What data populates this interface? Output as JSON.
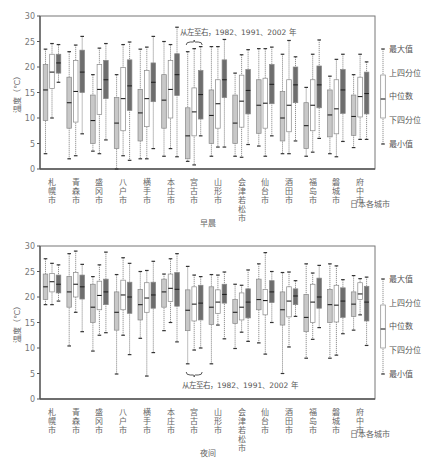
{
  "chart_data": [
    {
      "type": "box",
      "title": "早晨",
      "xlabel": "日本各城市",
      "ylabel": "温度（℃）",
      "ylim": [
        0,
        30
      ],
      "yticks": [
        0,
        5,
        10,
        15,
        20,
        25,
        30
      ],
      "annotation": "从左至右，1982、1991、2002 年",
      "series_names": [
        "1982",
        "1991",
        "2002"
      ],
      "categories": [
        "札幌市",
        "青森市",
        "盛冈市",
        "八户市",
        "横手市",
        "本庄市",
        "宫古市",
        "山形市",
        "会津若松市",
        "仙台市",
        "酒田市",
        "福岛市",
        "磐城市",
        "府中市"
      ],
      "boxes": [
        [
          [
            3.0,
            9.5,
            15.5,
            20.5,
            23.5
          ],
          [
            10.0,
            15.8,
            19.0,
            22.5,
            24.6
          ],
          [
            17.0,
            18.8,
            20.8,
            22.5,
            24.4
          ]
        ],
        [
          [
            2.0,
            8.0,
            13.0,
            18.0,
            23.0
          ],
          [
            2.6,
            9.2,
            15.2,
            21.3,
            24.3
          ],
          [
            6.9,
            15.0,
            19.0,
            23.3,
            26.0
          ]
        ],
        [
          [
            3.5,
            5.0,
            9.5,
            14.5,
            18.5
          ],
          [
            3.0,
            10.7,
            15.6,
            20.5,
            23.7
          ],
          [
            5.7,
            13.8,
            17.5,
            21.3,
            24.6
          ]
        ],
        [
          [
            0.0,
            4.0,
            9.0,
            14.0,
            18.5
          ],
          [
            2.6,
            7.5,
            13.8,
            19.9,
            24.4
          ],
          [
            1.7,
            11.5,
            16.3,
            21.4,
            24.9
          ]
        ],
        [
          [
            2.0,
            5.5,
            11.0,
            15.6,
            23.5
          ],
          [
            2.0,
            8.3,
            13.8,
            19.3,
            23.9
          ],
          [
            4.0,
            13.2,
            17.0,
            20.8,
            26.0
          ]
        ],
        [
          [
            2.5,
            8.0,
            13.5,
            18.5,
            25.0
          ],
          [
            4.0,
            10.0,
            15.6,
            21.3,
            24.4
          ],
          [
            2.4,
            14.4,
            18.5,
            22.6,
            27.8
          ]
        ],
        [
          [
            1.5,
            2.0,
            6.5,
            12.0,
            23.0
          ],
          [
            0.8,
            6.5,
            11.2,
            15.9,
            23.6
          ],
          [
            6.5,
            9.8,
            14.6,
            19.3,
            24.0
          ]
        ],
        [
          [
            2.5,
            5.0,
            10.5,
            15.5,
            24.0
          ],
          [
            4.3,
            8.0,
            12.8,
            17.5,
            24.0
          ],
          [
            4.3,
            14.0,
            17.5,
            21.4,
            25.4
          ]
        ],
        [
          [
            2.5,
            5.0,
            9.0,
            14.5,
            18.8
          ],
          [
            2.3,
            8.2,
            13.3,
            18.4,
            22.4
          ],
          [
            4.8,
            10.8,
            15.4,
            19.5,
            23.4
          ]
        ],
        [
          [
            4.5,
            7.0,
            12.5,
            17.5,
            23.6
          ],
          [
            2.5,
            8.0,
            12.9,
            17.8,
            23.6
          ],
          [
            6.5,
            12.8,
            16.6,
            20.5,
            23.9
          ]
        ],
        [
          [
            3.0,
            5.5,
            10.0,
            15.2,
            22.5
          ],
          [
            3.0,
            7.3,
            12.5,
            17.5,
            25.2
          ],
          [
            5.5,
            13.0,
            16.5,
            20.0,
            22.0
          ]
        ],
        [
          [
            2.5,
            4.0,
            8.5,
            13.0,
            16.0
          ],
          [
            3.3,
            7.5,
            12.5,
            17.5,
            22.5
          ],
          [
            6.0,
            12.0,
            16.5,
            20.2,
            25.3
          ]
        ],
        [
          [
            3.0,
            6.3,
            10.6,
            15.5,
            18.2
          ],
          [
            2.4,
            6.9,
            11.8,
            17.5,
            21.5
          ],
          [
            5.4,
            10.9,
            15.5,
            19.5,
            22.5
          ]
        ],
        [
          [
            4.2,
            6.6,
            10.3,
            14.5,
            18.5
          ],
          [
            5.8,
            10.2,
            14.2,
            18.0,
            22.5
          ],
          [
            5.8,
            10.8,
            14.8,
            19.0,
            21.0
          ]
        ]
      ]
    },
    {
      "type": "box",
      "title": "夜间",
      "xlabel": "日本各城市",
      "ylabel": "温度（℃）",
      "ylim": [
        0,
        30
      ],
      "yticks": [
        0,
        5,
        10,
        15,
        20,
        25,
        30
      ],
      "annotation": "从左至右，1982、1991、2002 年",
      "series_names": [
        "1982",
        "1991",
        "2002"
      ],
      "categories": [
        "札幌市",
        "青森市",
        "盛冈市",
        "八户市",
        "横手市",
        "本庄市",
        "宫古市",
        "山形市",
        "会津若松市",
        "仙台市",
        "酒田市",
        "福岛市",
        "磐城市",
        "府中市"
      ],
      "boxes": [
        [
          [
            18.5,
            19.5,
            22.0,
            24.5,
            27.5
          ],
          [
            18.5,
            21.0,
            23.0,
            24.6,
            26.6
          ],
          [
            19.2,
            20.8,
            22.5,
            24.3,
            26.3
          ]
        ],
        [
          [
            10.4,
            18.0,
            21.0,
            24.0,
            28.5
          ],
          [
            17.0,
            20.0,
            22.5,
            24.8,
            29.0
          ],
          [
            13.2,
            19.6,
            22.0,
            24.3,
            26.4
          ]
        ],
        [
          [
            9.4,
            15.0,
            18.0,
            22.5,
            24.0
          ],
          [
            12.5,
            17.5,
            20.3,
            23.1,
            26.3
          ],
          [
            13.0,
            18.5,
            21.0,
            23.5,
            28.8
          ]
        ],
        [
          [
            4.9,
            13.5,
            17.0,
            21.0,
            24.4
          ],
          [
            12.5,
            17.5,
            20.4,
            23.3,
            27.7
          ],
          [
            8.7,
            16.8,
            20.0,
            22.9,
            26.6
          ]
        ],
        [
          [
            11.9,
            15.5,
            18.5,
            21.5,
            25.0
          ],
          [
            4.5,
            17.0,
            19.8,
            22.8,
            25.2
          ],
          [
            9.1,
            17.8,
            20.4,
            22.9,
            27.0
          ]
        ],
        [
          [
            13.4,
            18.0,
            21.0,
            23.5,
            24.5
          ],
          [
            15.0,
            19.1,
            21.7,
            24.5,
            27.5
          ],
          [
            11.2,
            18.2,
            21.5,
            24.8,
            28.5
          ]
        ],
        [
          [
            6.9,
            13.4,
            17.4,
            21.4,
            26.0
          ],
          [
            9.6,
            15.3,
            18.6,
            22.0,
            24.3
          ],
          [
            10.0,
            15.5,
            18.8,
            22.3,
            24.0
          ]
        ],
        [
          [
            6.9,
            14.6,
            18.0,
            22.0,
            24.4
          ],
          [
            14.5,
            16.8,
            19.0,
            21.4,
            24.3
          ],
          [
            11.8,
            18.8,
            20.5,
            22.5,
            24.9
          ]
        ],
        [
          [
            9.9,
            14.8,
            17.0,
            19.5,
            22.5
          ],
          [
            13.1,
            15.5,
            18.0,
            20.8,
            22.3
          ],
          [
            11.3,
            15.9,
            19.0,
            21.6,
            25.3
          ]
        ],
        [
          [
            11.0,
            17.5,
            19.5,
            23.5,
            26.5
          ],
          [
            8.8,
            16.5,
            19.3,
            21.5,
            28.7
          ],
          [
            15.0,
            18.9,
            21.0,
            23.2,
            25.0
          ]
        ],
        [
          [
            5.0,
            14.5,
            17.5,
            21.0,
            24.8
          ],
          [
            10.2,
            16.1,
            19.2,
            22.0,
            24.9
          ],
          [
            16.2,
            18.5,
            20.2,
            21.6,
            23.2
          ]
        ],
        [
          [
            8.0,
            13.2,
            16.0,
            20.5,
            26.5
          ],
          [
            11.7,
            15.0,
            19.0,
            22.5,
            24.7
          ],
          [
            14.0,
            17.8,
            20.0,
            23.7,
            26.2
          ]
        ],
        [
          [
            8.0,
            15.0,
            18.5,
            21.5,
            26.5
          ],
          [
            8.6,
            15.1,
            18.4,
            22.3,
            26.1
          ],
          [
            12.8,
            16.0,
            19.2,
            21.8,
            23.4
          ]
        ],
        [
          [
            13.5,
            16.2,
            18.6,
            21.0,
            24.2
          ],
          [
            16.5,
            19.5,
            20.6,
            22.8,
            23.6
          ],
          [
            10.5,
            15.3,
            19.0,
            22.1,
            23.9
          ]
        ]
      ]
    }
  ],
  "panels": {
    "morning": {
      "title": "早晨",
      "ylabel": "温度（℃）",
      "x_group_label": "日本各城市",
      "annotation": "从左至右，1982、1991、2002 年"
    },
    "night": {
      "title": "夜间",
      "ylabel": "温度（℃）",
      "x_group_label": "日本各城市",
      "annotation": "从左至右，1982、1991、2002 年"
    }
  },
  "legend": {
    "items": [
      "最大值",
      "上四分位",
      "中位数",
      "下四分位",
      "最小值"
    ]
  },
  "colors": {
    "box_1982": "#c8c8c8",
    "box_1991": "#ffffff",
    "box_2002": "#6e6e6e",
    "axis": "#555555",
    "frame": "#777777",
    "text": "#555555"
  }
}
